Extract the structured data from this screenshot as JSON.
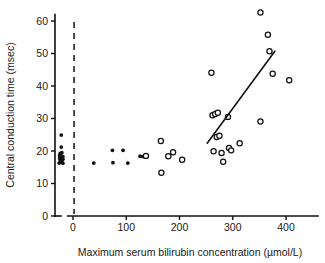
{
  "chart_data": {
    "type": "scatter",
    "title": "",
    "xlabel": "Maximum serum bilirubin concentration (µmol/L)",
    "ylabel": "Central conduction time (msec)",
    "xlim": [
      -45,
      430
    ],
    "ylim": [
      0,
      62
    ],
    "xticks": [
      0,
      100,
      200,
      300,
      400
    ],
    "xtick_labels": [
      "0",
      "100",
      "200",
      "300",
      "400"
    ],
    "yticks": [
      0,
      10,
      20,
      30,
      40,
      50,
      60
    ],
    "ytick_labels": [
      "0",
      "10",
      "20",
      "30",
      "40",
      "50",
      "60"
    ],
    "grid": false,
    "legend": false,
    "annotations": [
      {
        "name": "control-cutoff-dashed-line",
        "kind": "vline",
        "x": 2,
        "style": "dashed"
      },
      {
        "name": "regression-line",
        "kind": "line",
        "x1": 252,
        "y1": 22.4,
        "x2": 379,
        "y2": 50.7,
        "style": "solid"
      }
    ],
    "series": [
      {
        "name": "Controls",
        "marker": "filled-circle",
        "color": "#111111",
        "points": [
          [
            -22,
            24.9
          ],
          [
            -22,
            21.2
          ],
          [
            -24,
            19.3
          ],
          [
            -21,
            19.5
          ],
          [
            -25,
            18.6
          ],
          [
            -22,
            18.4
          ],
          [
            -19,
            18.3
          ],
          [
            -25,
            17.7
          ],
          [
            -22,
            17.6
          ],
          [
            -19,
            17.5
          ],
          [
            -24,
            16.9
          ],
          [
            -21,
            16.8
          ],
          [
            -26,
            16.3
          ],
          [
            -19,
            16.2
          ]
        ]
      },
      {
        "name": "Jaundiced infants (low bilirubin)",
        "marker": "filled-circle",
        "color": "#111111",
        "points": [
          [
            39,
            16.3
          ],
          [
            74,
            20.2
          ],
          [
            75,
            16.4
          ],
          [
            94,
            20.2
          ],
          [
            103,
            16.3
          ],
          [
            126,
            18.4
          ],
          [
            131,
            18.3
          ]
        ]
      },
      {
        "name": "Jaundiced infants (high bilirubin)",
        "marker": "open-circle",
        "color": "#111111",
        "points": [
          [
            137,
            18.5
          ],
          [
            165,
            23.1
          ],
          [
            166,
            13.3
          ],
          [
            179,
            18.4
          ],
          [
            188,
            19.6
          ],
          [
            205,
            17.3
          ],
          [
            260,
            44.1
          ],
          [
            262,
            31.0
          ],
          [
            264,
            19.9
          ],
          [
            267,
            31.4
          ],
          [
            270,
            24.3
          ],
          [
            272,
            31.8
          ],
          [
            275,
            24.7
          ],
          [
            279,
            19.4
          ],
          [
            282,
            16.7
          ],
          [
            291,
            30.5
          ],
          [
            293,
            20.9
          ],
          [
            297,
            20.2
          ],
          [
            313,
            22.4
          ],
          [
            352,
            62.6
          ],
          [
            352,
            29.1
          ],
          [
            366,
            55.8
          ],
          [
            369,
            50.7
          ],
          [
            375,
            43.8
          ],
          [
            406,
            41.8
          ]
        ]
      }
    ]
  }
}
